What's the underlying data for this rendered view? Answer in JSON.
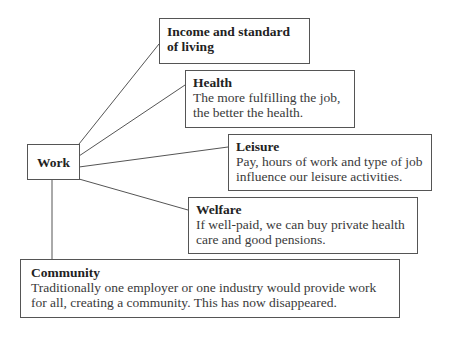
{
  "diagram": {
    "center": {
      "label": "Work"
    },
    "nodes": [
      {
        "id": "income",
        "title": "Income and standard of living",
        "description": ""
      },
      {
        "id": "health",
        "title": "Health",
        "description": "The more fulfilling the job, the better the health."
      },
      {
        "id": "leisure",
        "title": "Leisure",
        "description": "Pay, hours of work and type of job influence our leisure activities."
      },
      {
        "id": "welfare",
        "title": "Welfare",
        "description": "If well-paid, we can buy private health care and good pensions."
      },
      {
        "id": "community",
        "title": "Community",
        "description": "Traditionally one employer or one industry would provide work for all, creating a community. This has now disappeared."
      }
    ],
    "edges": [
      {
        "from": "Work",
        "to": "Income and standard of living"
      },
      {
        "from": "Work",
        "to": "Health"
      },
      {
        "from": "Work",
        "to": "Leisure"
      },
      {
        "from": "Work",
        "to": "Welfare"
      },
      {
        "from": "Work",
        "to": "Community"
      }
    ]
  }
}
